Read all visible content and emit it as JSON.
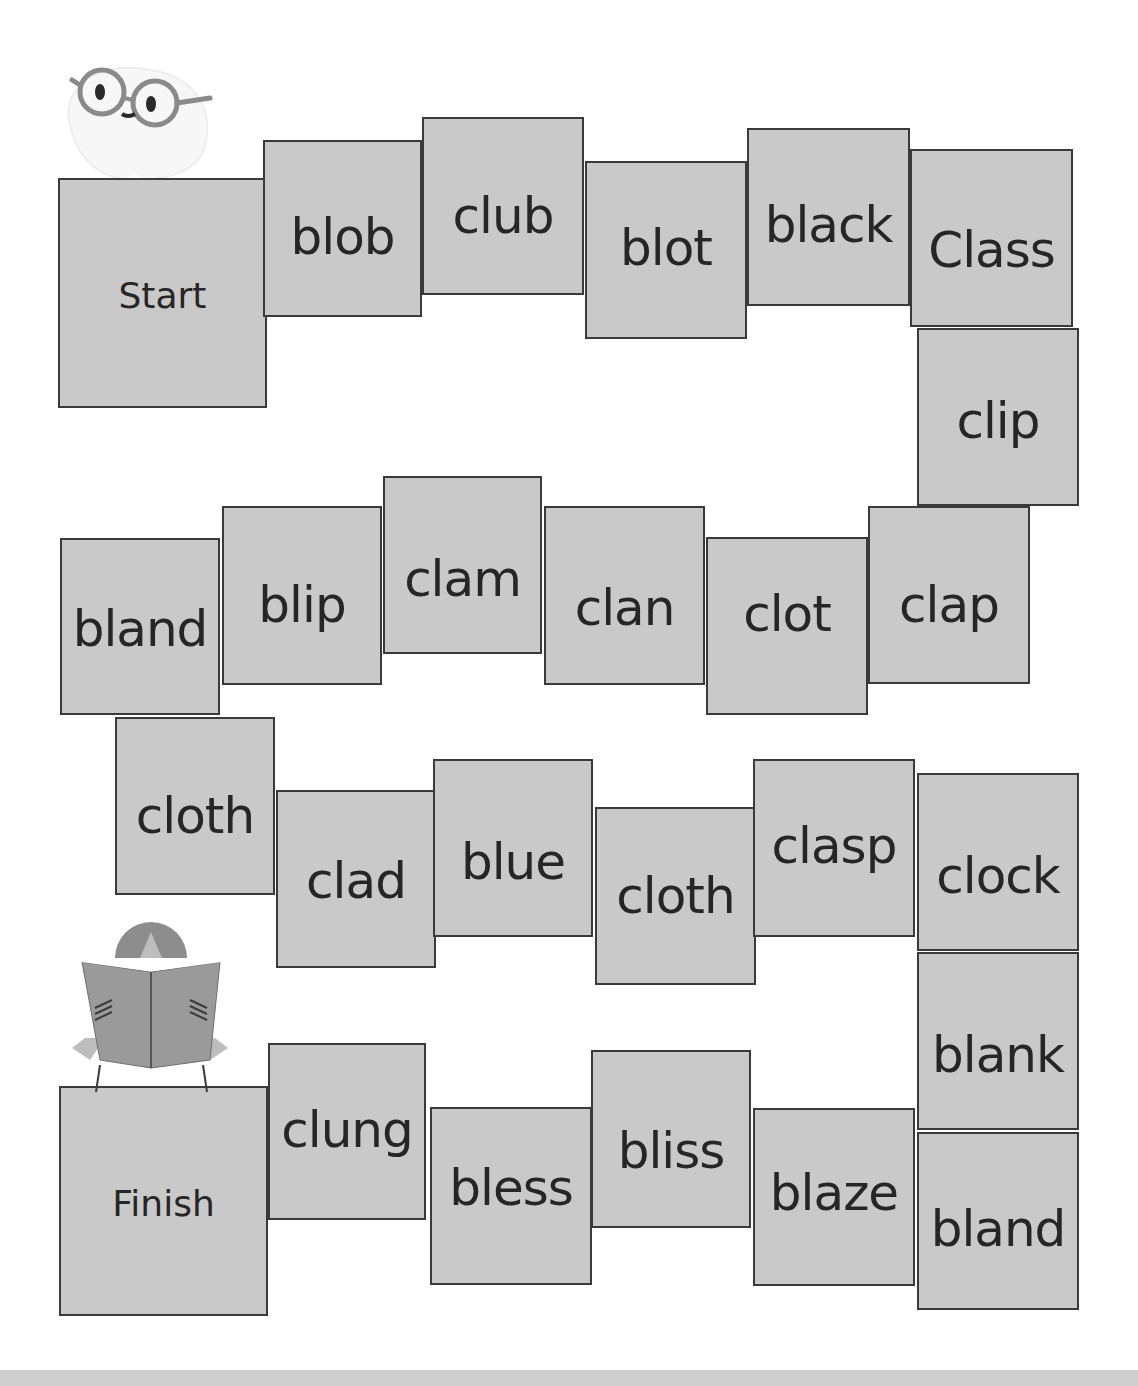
{
  "board": {
    "start_label": "Start",
    "finish_label": "Finish",
    "tiles": [
      {
        "word": "blob"
      },
      {
        "word": "club"
      },
      {
        "word": "blot"
      },
      {
        "word": "black"
      },
      {
        "word": "Class"
      },
      {
        "word": "clip"
      },
      {
        "word": "clap"
      },
      {
        "word": "clot"
      },
      {
        "word": "clan"
      },
      {
        "word": "clam"
      },
      {
        "word": "blip"
      },
      {
        "word": "bland"
      },
      {
        "word": "cloth"
      },
      {
        "word": "clad"
      },
      {
        "word": "blue"
      },
      {
        "word": "cloth"
      },
      {
        "word": "clasp"
      },
      {
        "word": "clock"
      },
      {
        "word": "blank"
      },
      {
        "word": "bland"
      },
      {
        "word": "blaze"
      },
      {
        "word": "bliss"
      },
      {
        "word": "bless"
      },
      {
        "word": "clung"
      }
    ]
  },
  "illustrations": {
    "top": "owl-with-glasses-icon",
    "bottom": "child-reading-book-icon"
  },
  "colors": {
    "tile_fill": "#c9c9c9",
    "tile_border": "#3a3a3a",
    "text": "#262626",
    "background": "#ffffff"
  }
}
